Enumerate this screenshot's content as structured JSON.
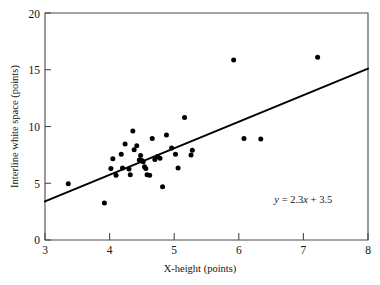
{
  "chart_data": {
    "type": "scatter",
    "title": "",
    "xlabel": "X-height (points)",
    "ylabel": "Interline white space (points)",
    "xlim": [
      3,
      8
    ],
    "ylim": [
      0,
      20
    ],
    "xticks": [
      3,
      4,
      5,
      6,
      7,
      8
    ],
    "yticks": [
      0,
      5,
      10,
      15,
      20
    ],
    "xtick_labels": [
      "3",
      "4",
      "5",
      "6",
      "7",
      "8"
    ],
    "ytick_labels": [
      "0",
      "5",
      "10",
      "15",
      "20"
    ],
    "grid": false,
    "legend": null,
    "annotations": [
      {
        "name": "regression-equation",
        "text": "y = 2.3x + 3.5",
        "x": 6.55,
        "y": 3.3
      }
    ],
    "fit_line": {
      "label": "y = 2.3x + 3.5",
      "slope": 2.3,
      "intercept": 3.5,
      "drawn_from": {
        "x": 3.0,
        "y": 3.4
      },
      "drawn_to": {
        "x": 8.0,
        "y": 15.1
      }
    },
    "series": [
      {
        "name": "typeface samples",
        "marker": "filled-circle",
        "color": "#000000",
        "points": [
          {
            "x": 3.36,
            "y": 4.95
          },
          {
            "x": 3.92,
            "y": 3.25
          },
          {
            "x": 4.02,
            "y": 6.3
          },
          {
            "x": 4.05,
            "y": 7.15
          },
          {
            "x": 4.1,
            "y": 5.7
          },
          {
            "x": 4.18,
            "y": 7.55
          },
          {
            "x": 4.2,
            "y": 6.35
          },
          {
            "x": 4.24,
            "y": 8.45
          },
          {
            "x": 4.3,
            "y": 6.25
          },
          {
            "x": 4.32,
            "y": 5.75
          },
          {
            "x": 4.36,
            "y": 9.6
          },
          {
            "x": 4.38,
            "y": 7.95
          },
          {
            "x": 4.42,
            "y": 8.3
          },
          {
            "x": 4.46,
            "y": 7.05
          },
          {
            "x": 4.48,
            "y": 7.45
          },
          {
            "x": 4.5,
            "y": 7.0
          },
          {
            "x": 4.52,
            "y": 6.9
          },
          {
            "x": 4.54,
            "y": 6.45
          },
          {
            "x": 4.56,
            "y": 6.3
          },
          {
            "x": 4.58,
            "y": 5.75
          },
          {
            "x": 4.62,
            "y": 5.7
          },
          {
            "x": 4.66,
            "y": 8.95
          },
          {
            "x": 4.7,
            "y": 7.1
          },
          {
            "x": 4.74,
            "y": 7.35
          },
          {
            "x": 4.78,
            "y": 7.2
          },
          {
            "x": 4.82,
            "y": 4.7
          },
          {
            "x": 4.88,
            "y": 9.25
          },
          {
            "x": 4.96,
            "y": 8.1
          },
          {
            "x": 5.02,
            "y": 7.55
          },
          {
            "x": 5.06,
            "y": 6.35
          },
          {
            "x": 5.16,
            "y": 10.8
          },
          {
            "x": 5.26,
            "y": 7.5
          },
          {
            "x": 5.28,
            "y": 7.9
          },
          {
            "x": 5.92,
            "y": 15.85
          },
          {
            "x": 6.08,
            "y": 8.95
          },
          {
            "x": 6.34,
            "y": 8.9
          },
          {
            "x": 7.22,
            "y": 16.1
          }
        ]
      }
    ]
  },
  "axes": {
    "y_title": "Interline white space (points)",
    "x_title": "X-height (points)"
  }
}
